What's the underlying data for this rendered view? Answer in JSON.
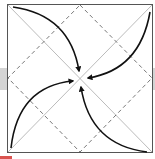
{
  "diagram": {
    "square": {
      "x": 7,
      "y": 4,
      "size": 145
    },
    "colors": {
      "border": "#555555",
      "diagonal": "#aaaaaa",
      "dashed": "#555555",
      "arrow": "#111111",
      "side_tab": "#d4d4d4",
      "accent": "#d9534f"
    },
    "elements": [
      {
        "type": "diagonal",
        "from": "top-left",
        "to": "bottom-right"
      },
      {
        "type": "diagonal",
        "from": "top-right",
        "to": "bottom-left"
      },
      {
        "type": "dashed-diamond",
        "vertices": [
          "top-mid",
          "right-mid",
          "bottom-mid",
          "left-mid"
        ]
      },
      {
        "type": "curved-arrow",
        "from": "top-left",
        "to": "center-top"
      },
      {
        "type": "curved-arrow",
        "from": "top-right",
        "to": "center-right"
      },
      {
        "type": "curved-arrow",
        "from": "bottom-right",
        "to": "center-bottom"
      },
      {
        "type": "curved-arrow",
        "from": "bottom-left",
        "to": "center-left"
      }
    ],
    "caption": ""
  }
}
